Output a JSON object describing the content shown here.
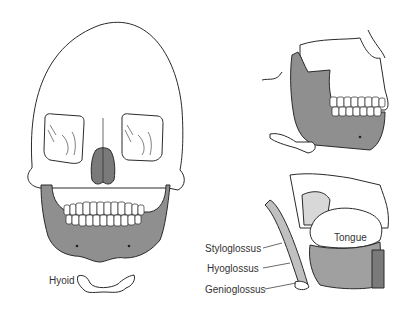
{
  "figure": {
    "panels": [
      {
        "id": "frontal",
        "subject": "skull-frontal-view",
        "highlight": "mandible"
      },
      {
        "id": "lateral-top",
        "subject": "skull-lateral-view",
        "highlight": "mandible"
      },
      {
        "id": "lateral-bottom",
        "subject": "tongue-muscles-lateral-view"
      }
    ],
    "labels": {
      "hyoid": "Hyoid",
      "tongue": "Tongue",
      "styloglossus": "Styloglossus",
      "hyoglossus": "Hyoglossus",
      "genioglossus": "Genioglossus"
    },
    "colors": {
      "outline": "#2a2a2a",
      "mandible_fill": "#8f8f8f",
      "muscle_fill": "#a0a0a0",
      "background": "#ffffff"
    }
  }
}
